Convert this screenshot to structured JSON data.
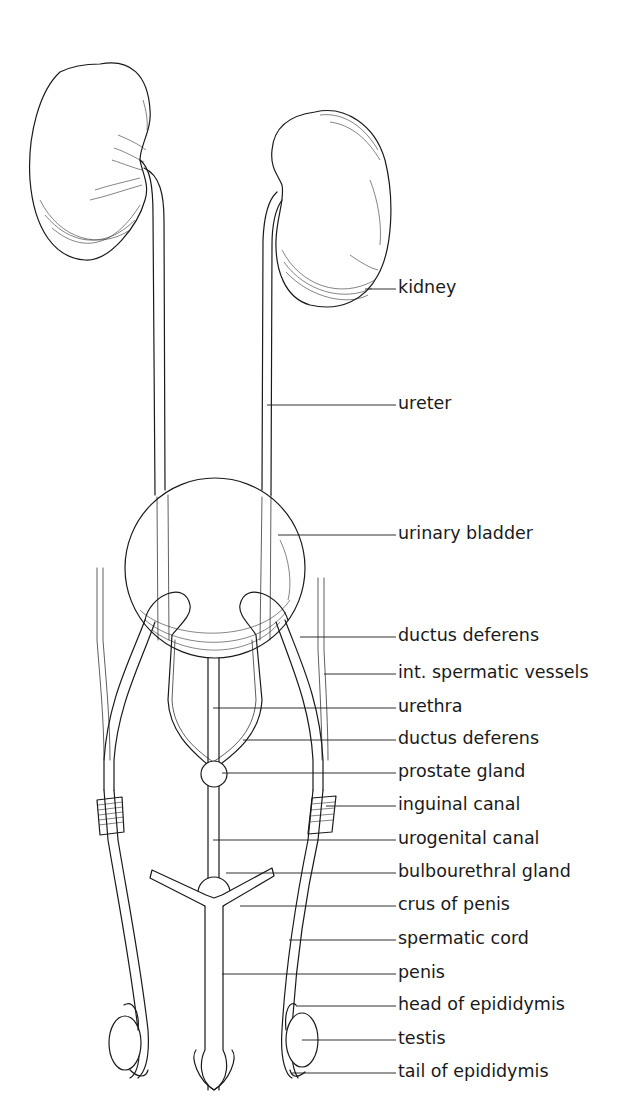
{
  "figure": {
    "colors": {
      "ink": "#1a1a1a",
      "background": "#ffffff"
    },
    "labels": [
      {
        "id": "kidney",
        "text": "kidney",
        "y": 289,
        "x0": 365
      },
      {
        "id": "ureter",
        "text": "ureter",
        "y": 405,
        "x0": 267
      },
      {
        "id": "urinary-bladder",
        "text": "urinary bladder",
        "y": 535,
        "x0": 278
      },
      {
        "id": "ductus-deferens-upper",
        "text": "ductus deferens",
        "y": 637,
        "x0": 300
      },
      {
        "id": "int-spermatic-vessels",
        "text": "int. spermatic vessels",
        "y": 674,
        "x0": 324
      },
      {
        "id": "urethra",
        "text": "urethra",
        "y": 708,
        "x0": 213
      },
      {
        "id": "ductus-deferens-lower",
        "text": "ductus deferens",
        "y": 740,
        "x0": 243
      },
      {
        "id": "prostate-gland",
        "text": "prostate gland",
        "y": 773,
        "x0": 222
      },
      {
        "id": "inguinal-canal",
        "text": "inguinal canal",
        "y": 806,
        "x0": 326
      },
      {
        "id": "urogenital-canal",
        "text": "urogenital canal",
        "y": 840,
        "x0": 213
      },
      {
        "id": "bulbourethral-gland",
        "text": "bulbourethral gland",
        "y": 873,
        "x0": 226
      },
      {
        "id": "crus-of-penis",
        "text": "crus of penis",
        "y": 906,
        "x0": 240
      },
      {
        "id": "spermatic-cord",
        "text": "spermatic cord",
        "y": 940,
        "x0": 289
      },
      {
        "id": "penis",
        "text": "penis",
        "y": 974,
        "x0": 222
      },
      {
        "id": "head-of-epididymis",
        "text": "head of epididymis",
        "y": 1006,
        "x0": 296
      },
      {
        "id": "testis",
        "text": "testis",
        "y": 1040,
        "x0": 302
      },
      {
        "id": "tail-of-epididymis",
        "text": "tail of epididymis",
        "y": 1073,
        "x0": 292
      }
    ]
  }
}
